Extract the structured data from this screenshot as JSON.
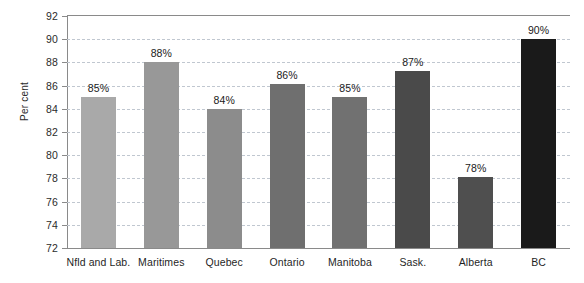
{
  "chart_data": {
    "type": "bar",
    "title": "",
    "subtitle": "",
    "xlabel": "",
    "ylabel": "Per cent",
    "ylim": [
      72,
      92
    ],
    "y_ticks": [
      72,
      74,
      76,
      78,
      80,
      82,
      84,
      86,
      88,
      90,
      92
    ],
    "grid": true,
    "legend": false,
    "categories": [
      "Nfld and Lab.",
      "Maritimes",
      "Quebec",
      "Ontario",
      "Manitoba",
      "Sask.",
      "Alberta",
      "BC"
    ],
    "values": [
      85.0,
      88.0,
      84.0,
      86.1,
      85.0,
      87.3,
      78.1,
      90.0
    ],
    "data_labels": [
      "85%",
      "88%",
      "84%",
      "86%",
      "85%",
      "87%",
      "78%",
      "90%"
    ],
    "bar_colors": [
      "#a9a9a9",
      "#989898",
      "#8c8c8c",
      "#6f6f6f",
      "#717171",
      "#4a4a4a",
      "#4f4f4f",
      "#1a1a1a"
    ],
    "axis_color": "#8a8a8a",
    "gridline_color": "#c0c7d0",
    "background_color": "#ffffff"
  }
}
